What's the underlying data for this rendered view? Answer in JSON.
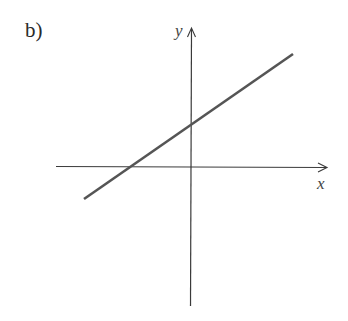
{
  "figure": {
    "panel_label": "b)",
    "x_axis_label": "x",
    "y_axis_label": "y"
  },
  "colors": {
    "axis": "#3a3a3a",
    "line": "#555555",
    "background": "#ffffff"
  },
  "geometry": {
    "origin": [
      191,
      167
    ],
    "x_axis": {
      "x1": 56,
      "y1": 166,
      "x2": 327,
      "y2": 168
    },
    "y_axis": {
      "x1": 190,
      "y1": 306,
      "x2": 192,
      "y2": 28
    },
    "line": {
      "x1": 84,
      "y1": 199,
      "x2": 293,
      "y2": 54
    },
    "x_intercept": [
      130,
      167
    ],
    "y_intercept": [
      191,
      124
    ]
  },
  "chart_data": {
    "type": "line",
    "title": "b)",
    "xlabel": "x",
    "ylabel": "y",
    "grid": false,
    "series": [
      {
        "name": "line",
        "slope_sign": "positive",
        "x_intercept_sign": "negative",
        "y_intercept_sign": "positive"
      }
    ]
  }
}
